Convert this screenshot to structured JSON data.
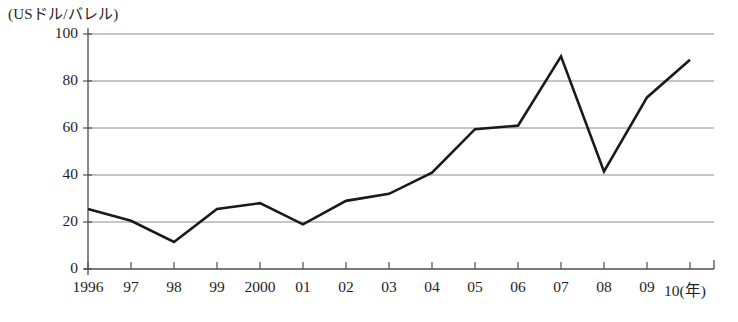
{
  "chart_data": {
    "type": "line",
    "title": "",
    "unit_label": "(USドル/バレル)",
    "xlabel": "(年)",
    "ylabel": "",
    "categories": [
      "1996",
      "97",
      "98",
      "99",
      "2000",
      "01",
      "02",
      "03",
      "04",
      "05",
      "06",
      "07",
      "08",
      "09",
      "10"
    ],
    "values": [
      25.5,
      20.5,
      11.5,
      25.5,
      28.0,
      19.0,
      29.0,
      32.0,
      41.0,
      59.5,
      61.0,
      90.5,
      41.5,
      73.0,
      89.0
    ],
    "ylim": [
      0,
      100
    ],
    "yticks": [
      0,
      20,
      40,
      60,
      80,
      100
    ],
    "ytick_labels": [
      "0",
      "20",
      "40",
      "60",
      "80",
      "100"
    ],
    "xtick_labels": [
      "1996",
      "97",
      "98",
      "99",
      "2000",
      "01",
      "02",
      "03",
      "04",
      "05",
      "06",
      "07",
      "08",
      "09",
      "10"
    ],
    "grid": true,
    "grid_axis": "y",
    "legend": false,
    "legend_position": "none",
    "series": [
      {
        "name": "原油価格",
        "color": "#1a1a1a",
        "values": [
          25.5,
          20.5,
          11.5,
          25.5,
          28.0,
          19.0,
          29.0,
          32.0,
          41.0,
          59.5,
          61.0,
          90.5,
          41.5,
          73.0,
          89.0
        ]
      }
    ],
    "colors": {
      "line": "#1a1a1a",
      "grid": "#8c8c8c",
      "axis": "#4d4d4d",
      "text": "#1f1f1f",
      "background": "#ffffff"
    }
  }
}
